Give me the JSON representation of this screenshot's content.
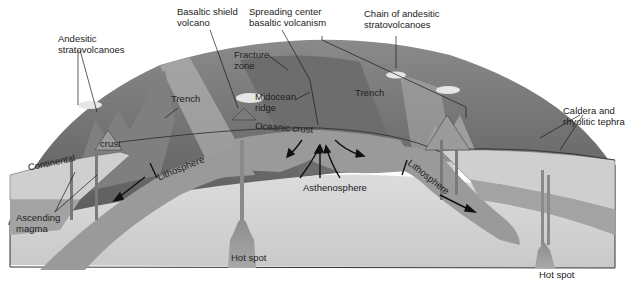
{
  "diagram": {
    "type": "plate-tectonics-cross-section",
    "labels": {
      "andesitic_stratovolcanoes": "Andesitic\nstratovolcanoes",
      "andesitic_1": "Andesitic",
      "andesitic_2": "stratovolcanoes",
      "basaltic_shield_1": "Basaltic shield",
      "basaltic_shield_2": "volcano",
      "spreading_1": "Spreading center",
      "spreading_2": "basaltic volcanism",
      "chain_1": "Chain of andesitic",
      "chain_2": "stratovolcanoes",
      "fracture_1": "Fracture",
      "fracture_2": "zone",
      "trench_left": "Trench",
      "trench_right": "Trench",
      "midocean_1": "Midocean",
      "midocean_2": "ridge",
      "oceanic_crust": "Oceanic crust",
      "caldera_1": "Caldera and",
      "caldera_2": "rhyolitic tephra",
      "continental": "Continental",
      "crust": "crust",
      "lithosphere_left": "Lithosphere",
      "lithosphere_right": "Lithosphere",
      "asthenosphere": "Asthenosphere",
      "ascending_1": "Ascending",
      "ascending_2": "magma",
      "hot_spot_center": "Hot spot",
      "hot_spot_right": "Hot spot"
    },
    "colors": {
      "sky_surface": "#7a7a7a",
      "ocean_floor": "#5e5e5e",
      "lithosphere": "#9a9a9a",
      "asthenosphere": "#d4d4d4",
      "crust": "#c8c8c8",
      "line": "#1a1a1a"
    }
  }
}
